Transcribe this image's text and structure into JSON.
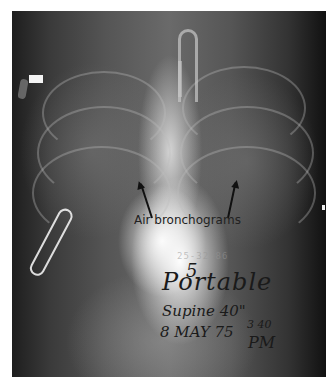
{
  "image": {
    "subject": "Chest radiograph (frontal, portable)",
    "background_color": "#ffffff"
  },
  "annotation": {
    "label": "Air bronchograms",
    "arrow_count": 2,
    "arrow_color": "#111111"
  },
  "film_markings": {
    "stamp": "25-32-86",
    "handwriting": {
      "number": "5",
      "line1": "Portable",
      "line2": "Supine 40\"",
      "line3": "8 MAY 75",
      "time": "3 40",
      "meridiem": "PM"
    }
  }
}
